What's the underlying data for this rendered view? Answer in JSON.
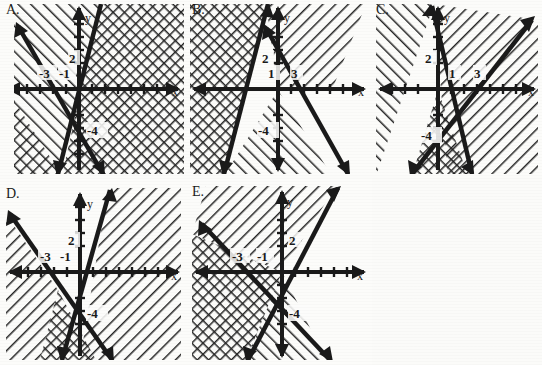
{
  "figure": {
    "background": "#fbfbf9",
    "ink": "#1a1a1a",
    "panel_count": 5
  },
  "axis_labels": {
    "x": "x",
    "y": "y"
  },
  "panels": [
    {
      "id": "A",
      "label": "A.",
      "x_label": "x",
      "y_label": "y",
      "tick_labels": [
        "-3",
        "-1",
        "2",
        "-4"
      ],
      "lines": [
        {
          "name": "steep-line",
          "through": [
            "-1,0",
            "0,2"
          ],
          "direction": "up-right-steep"
        },
        {
          "name": "shallow-line",
          "through": [
            "-3,0",
            "0,-4"
          ],
          "direction": "down-right"
        }
      ],
      "regions": [
        {
          "name": "left-hatch",
          "pattern": "diagonal-up-right",
          "side": "upper-left"
        },
        {
          "name": "right-hatch",
          "pattern": "cross-hatch",
          "side": "right"
        },
        {
          "name": "bottom-hatch",
          "pattern": "diagonal-down-right",
          "side": "lower-left"
        }
      ]
    },
    {
      "id": "B",
      "label": "B.",
      "x_label": "x",
      "y_label": "y",
      "tick_labels": [
        "2",
        "1",
        "3",
        "-4"
      ],
      "lines": [
        {
          "name": "steep-line",
          "through": [
            "1,0",
            "0,2"
          ],
          "direction": "up-left-steep"
        },
        {
          "name": "shallow-line",
          "through": [
            "3,0",
            "0,-4"
          ],
          "direction": "down-right"
        }
      ],
      "regions": [
        {
          "name": "left-hatch",
          "pattern": "cross-hatch",
          "side": "left"
        },
        {
          "name": "upper-right-hatch",
          "pattern": "diagonal-down-right",
          "side": "upper-right"
        },
        {
          "name": "lower-hatch",
          "pattern": "diagonal-up-right",
          "side": "lower-right"
        }
      ]
    },
    {
      "id": "C",
      "label": "C.",
      "x_label": "x",
      "y_label": "y",
      "tick_labels": [
        "2",
        "1",
        "3",
        "-4"
      ],
      "lines": [
        {
          "name": "steep-line",
          "through": [
            "1,0",
            "0,2"
          ],
          "direction": "up-left-steep"
        },
        {
          "name": "shallow-line",
          "through": [
            "3,0",
            "0,-4"
          ],
          "direction": "up-right"
        }
      ],
      "regions": [
        {
          "name": "left-hatch",
          "pattern": "diagonal-up-right",
          "side": "left"
        },
        {
          "name": "right-hatch",
          "pattern": "diagonal-down-right",
          "side": "right"
        },
        {
          "name": "bottom-wedge",
          "pattern": "cross-hatch",
          "side": "bottom"
        }
      ]
    },
    {
      "id": "D",
      "label": "D.",
      "x_label": "x",
      "y_label": "y",
      "tick_labels": [
        "-3",
        "-1",
        "2",
        "-4"
      ],
      "lines": [
        {
          "name": "steep-line",
          "through": [
            "-1,0",
            "0,2"
          ],
          "direction": "up-right-steep"
        },
        {
          "name": "shallow-line",
          "through": [
            "-3,0",
            "0,-4"
          ],
          "direction": "down-right"
        }
      ],
      "regions": [
        {
          "name": "left-hatch",
          "pattern": "diagonal-down-right",
          "side": "left"
        },
        {
          "name": "right-hatch",
          "pattern": "diagonal-down-right",
          "side": "right"
        },
        {
          "name": "bottom-wedge",
          "pattern": "cross-hatch",
          "side": "bottom"
        }
      ]
    },
    {
      "id": "E",
      "label": "E.",
      "x_label": "x",
      "y_label": "y",
      "tick_labels": [
        "-3",
        "-1",
        "2",
        "-4"
      ],
      "lines": [
        {
          "name": "steep-line",
          "through": [
            "-1,0",
            "0,2"
          ],
          "direction": "up-right-steep"
        },
        {
          "name": "shallow-line",
          "through": [
            "-3,0",
            "0,-4"
          ],
          "direction": "down-right"
        }
      ],
      "regions": [
        {
          "name": "upper-hatch",
          "pattern": "diagonal-down-right",
          "side": "upper"
        },
        {
          "name": "left-hatch",
          "pattern": "cross-hatch",
          "side": "left"
        },
        {
          "name": "lower-hatch",
          "pattern": "diagonal-up-right",
          "side": "lower"
        }
      ]
    }
  ]
}
